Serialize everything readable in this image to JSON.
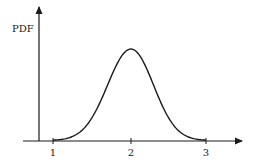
{
  "chart_data": {
    "type": "line",
    "title": "",
    "xlabel": "",
    "ylabel": "PDF",
    "x_ticks": [
      "1",
      "2",
      "3"
    ],
    "xlim": [
      0.8,
      3.45
    ],
    "grid": false,
    "legend": null,
    "series": [
      {
        "name": "PDF",
        "description": "Bell-shaped (normal-like) density centered at x = 2",
        "mean": 2,
        "std_approx": 0.3,
        "x": [
          1.0,
          1.2,
          1.4,
          1.5,
          1.6,
          1.7,
          1.8,
          1.9,
          2.0,
          2.1,
          2.2,
          2.3,
          2.4,
          2.5,
          2.6,
          2.8,
          3.0
        ],
        "y_relative": [
          0.004,
          0.029,
          0.135,
          0.249,
          0.411,
          0.607,
          0.801,
          0.946,
          1.0,
          0.946,
          0.801,
          0.607,
          0.411,
          0.249,
          0.135,
          0.029,
          0.004
        ]
      }
    ]
  },
  "axes": {
    "y_label": "PDF",
    "x_ticks": [
      {
        "label": "1",
        "px": 53
      },
      {
        "label": "2",
        "px": 131
      },
      {
        "label": "3",
        "px": 206
      }
    ]
  }
}
